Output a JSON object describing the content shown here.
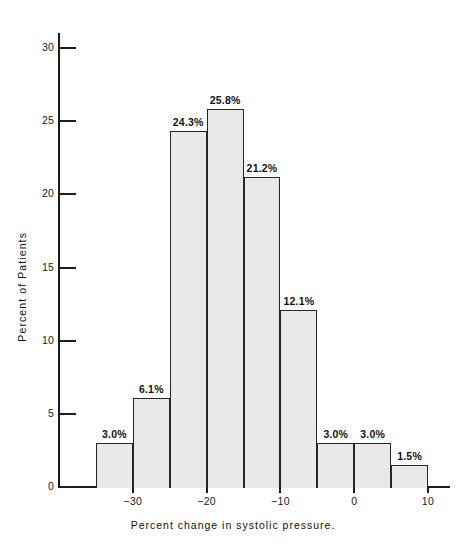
{
  "chart_data": {
    "type": "bar",
    "title": "",
    "xlabel": "Percent change in systolic pressure.",
    "ylabel": "Percent of Patients",
    "grid": false,
    "legend": "none",
    "bin_width": 5,
    "bin_edges": [
      -35,
      -30,
      -25,
      -20,
      -15,
      -10,
      -5,
      0,
      5,
      10
    ],
    "categories": [
      "-35 to -30",
      "-30 to -25",
      "-25 to -20",
      "-20 to -15",
      "-15 to -10",
      "-10 to -5",
      "-5 to 0",
      "0 to 5",
      "5 to 10"
    ],
    "values": [
      3.0,
      6.1,
      24.3,
      25.8,
      21.2,
      12.1,
      3.0,
      3.0,
      1.5
    ],
    "data_labels": [
      "3.0%",
      "6.1%",
      "24.3%",
      "25.8%",
      "21.2%",
      "12.1%",
      "3.0%",
      "3.0%",
      "1.5%"
    ],
    "xlim": [
      -37.5,
      12.5
    ],
    "ylim": [
      0,
      31
    ],
    "xticks": [
      -30,
      -20,
      -10,
      0,
      10
    ],
    "xtick_labels": [
      "−30",
      "−20",
      "−10",
      "0",
      "10"
    ],
    "yticks": [
      0,
      5,
      10,
      15,
      20,
      25,
      30
    ],
    "ytick_labels": [
      "0",
      "5",
      "10",
      "15",
      "20",
      "25",
      "30"
    ],
    "bar_fill_color": "#e9e9e9",
    "bar_edge_color": "#262626",
    "axis_color": "#1c1c1c"
  }
}
